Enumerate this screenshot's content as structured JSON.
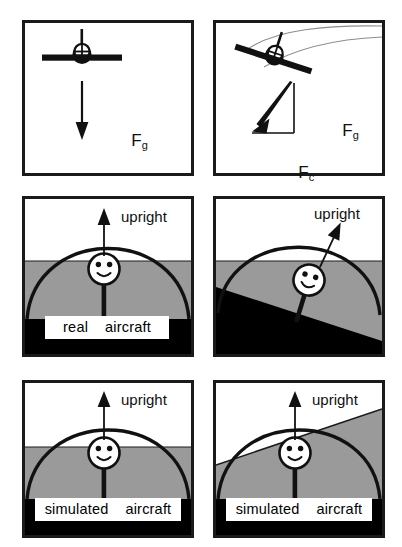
{
  "figure": {
    "colors": {
      "ink": "#111111",
      "border": "#1a1a1a",
      "gray_band": "#9a9a9a",
      "black_base": "#000000",
      "paper": "#ffffff"
    }
  },
  "panels": [
    {
      "id": "top-left",
      "name": "level-flight-gravity",
      "aircraft_view": "rear-view-level",
      "vectors": [
        {
          "name": "Fg",
          "symbol": "F",
          "subscript": "g",
          "direction": "down",
          "label": "F"
        }
      ]
    },
    {
      "id": "top-right",
      "name": "banked-turn-forces",
      "aircraft_view": "rear-view-banked",
      "vectors": [
        {
          "name": "Fg",
          "symbol": "F",
          "subscript": "g",
          "direction": "down",
          "label": "F"
        },
        {
          "name": "Fc",
          "symbol": "F",
          "subscript": "c",
          "direction": "left",
          "label": "F"
        }
      ]
    },
    {
      "id": "mid-left",
      "name": "real-aircraft-upright",
      "caption": "real    aircraft",
      "arrow_label": "upright",
      "arrow_tilt_deg": 0,
      "horizon_tilt_deg": 0
    },
    {
      "id": "mid-right",
      "name": "real-aircraft-banked",
      "caption": "",
      "arrow_label": "upright",
      "arrow_tilt_deg": 25,
      "horizon_tilt_deg": 20
    },
    {
      "id": "bot-left",
      "name": "simulated-aircraft-upright",
      "caption": "simulated    aircraft",
      "arrow_label": "upright",
      "arrow_tilt_deg": 0,
      "horizon_tilt_deg": 0
    },
    {
      "id": "bot-right",
      "name": "simulated-aircraft-banked",
      "caption": "simulated    aircraft",
      "arrow_label": "upright",
      "arrow_tilt_deg": 0,
      "horizon_tilt_deg": 17
    }
  ],
  "labels": {
    "upright": "upright",
    "F": "F",
    "sub_g": "g",
    "sub_c": "c",
    "real_aircraft": "real    aircraft",
    "simulated_aircraft": "simulated    aircraft"
  }
}
